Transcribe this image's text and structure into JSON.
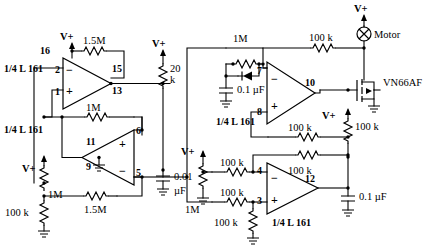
{
  "diagram": {
    "supply_label": "V+",
    "ground_symbol": "earth-ground"
  },
  "opamps": [
    {
      "id": "A1",
      "part": "1/4 L 161",
      "pin_power": "16",
      "pin_minus": "2",
      "pin_plus": "1",
      "pin_out": "13",
      "pin_extra": "15",
      "orientation": "right"
    },
    {
      "id": "A2",
      "part": "1/4 L 161",
      "pin_out": "11",
      "pin_gnd": "9",
      "pin_plus": "6",
      "pin_minus": "5",
      "orientation": "left"
    },
    {
      "id": "A3",
      "part": "1/4 L 161",
      "pin_minus": "7",
      "pin_plus": "8",
      "pin_out": "10",
      "orientation": "right"
    },
    {
      "id": "A4",
      "part": "1/4 L 161",
      "pin_minus": "4",
      "pin_plus": "3",
      "pin_out": "12",
      "orientation": "right"
    }
  ],
  "resistors": [
    {
      "name": "r-1p5M-top",
      "value": "1.5M"
    },
    {
      "name": "r-1M-a1-fb",
      "value": "1M"
    },
    {
      "name": "r-20k",
      "value": "20",
      "value2": "k"
    },
    {
      "name": "r-1p5M-bottom",
      "value": "1.5M"
    },
    {
      "name": "r-1M-left",
      "value": "1M"
    },
    {
      "name": "r-100k-left",
      "value": "100 k"
    },
    {
      "name": "r-1M-a3-fb",
      "value": "1M"
    },
    {
      "name": "r-100k-gate",
      "value": "100 k"
    },
    {
      "name": "r-100k-a3-fb",
      "value": "100 k"
    },
    {
      "name": "r-100k-pulldown",
      "value": "100 k"
    },
    {
      "name": "r-1M-mid",
      "value": "1M"
    },
    {
      "name": "r-100k-a4-in-minus",
      "value": "100 k"
    },
    {
      "name": "r-100k-a4-fb",
      "value": "100 k"
    },
    {
      "name": "r-100k-a4-in-plus",
      "value": "100 k"
    },
    {
      "name": "r-100k-a4-plus-gnd",
      "value": "100 k"
    }
  ],
  "capacitors": [
    {
      "name": "c-0p01uF",
      "value": "0.01",
      "unit": "µF"
    },
    {
      "name": "c-0p1uF-a3",
      "value": "0.1 µF"
    },
    {
      "name": "c-0p1uF-a4",
      "value": "0.1 µF"
    }
  ],
  "devices": [
    {
      "name": "motor",
      "label": "Motor"
    },
    {
      "name": "mosfet",
      "label": "VN66AF"
    },
    {
      "name": "diode",
      "label": ""
    }
  ],
  "supply_labels": [
    {
      "name": "vplus-a1",
      "text": "V+"
    },
    {
      "name": "vplus-20k",
      "text": "V+"
    },
    {
      "name": "vplus-left",
      "text": "V+"
    },
    {
      "name": "vplus-mid",
      "text": "V+"
    },
    {
      "name": "vplus-motor",
      "text": "V+"
    },
    {
      "name": "vplus-gate",
      "text": "V+"
    }
  ]
}
